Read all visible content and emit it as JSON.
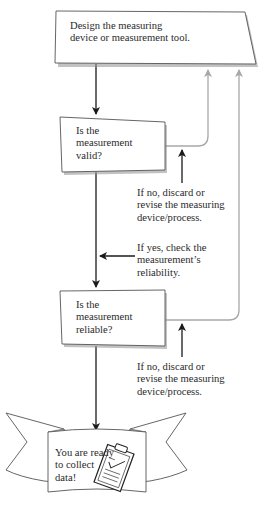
{
  "diagram": {
    "nodes": {
      "design": {
        "lines": [
          "Design the measuring",
          "device or measurement tool."
        ]
      },
      "valid": {
        "lines": [
          "Is the",
          "measurement",
          "valid?"
        ]
      },
      "reliable": {
        "lines": [
          "Is the",
          "measurement",
          "reliable?"
        ]
      },
      "ready": {
        "lines": [
          "You are ready",
          "to collect",
          "data!"
        ]
      }
    },
    "labels": {
      "valid_no": {
        "lines": [
          "If no, discard or",
          "revise the measuring",
          "device/process."
        ]
      },
      "valid_yes": {
        "lines": [
          "If yes, check the",
          "measurement’s",
          "reliability."
        ]
      },
      "reliable_no": {
        "lines": [
          "If no, discard or",
          "revise the measuring",
          "device/process."
        ]
      }
    },
    "icons": {
      "clipboard": "clipboard-checklist-icon",
      "banner": "ribbon-banner"
    },
    "colors": {
      "main_flow": "#1a1a1a",
      "feedback_flow": "#a8a8a8",
      "box_fill": "#ffffff",
      "box_shadow": "#9a9a9a",
      "banner_fold": "#c8c8c8"
    }
  }
}
